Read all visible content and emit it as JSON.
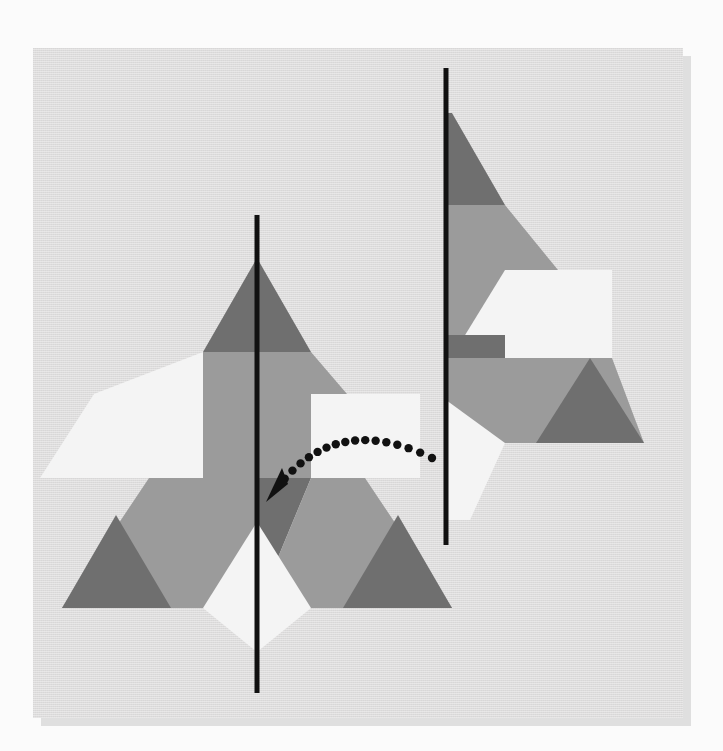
{
  "scene": {
    "title": "Mirror symmetry shape puzzle",
    "canvas": {
      "width": 723,
      "height": 751
    },
    "page_background": "#fbfbfb",
    "card": {
      "x": 33,
      "y": 48,
      "width": 650,
      "height": 670,
      "fill": "#dddcdc",
      "shadow_fill": "#c9c9c9",
      "shadow_offset": {
        "x": 8,
        "y": 8
      }
    }
  },
  "palette": {
    "dark_gray": "#6f6f6f",
    "mid_gray": "#9b9b9b",
    "light_gray": "#b0b0b0",
    "off_white": "#f4f4f4",
    "line_black": "#111111",
    "card_gray": "#dddcdc",
    "page_white": "#fbfbfb"
  },
  "mirror_lines": [
    {
      "name": "left-mirror-line",
      "x1": 257,
      "y1": 215,
      "x2": 257,
      "y2": 693,
      "stroke": "#111111",
      "stroke_width": 5
    },
    {
      "name": "right-mirror-line",
      "x1": 446,
      "y1": 68,
      "x2": 446,
      "y2": 545,
      "stroke": "#111111",
      "stroke_width": 5
    }
  ],
  "left_figure": {
    "name": "left-triskelion-figure",
    "description": "Full triangular pinwheel of hexagons, rhombi and triangles bisected by a vertical mirror line",
    "apex": {
      "x": 257,
      "y": 258
    },
    "baseline_y": 608,
    "left_corner_x": 62,
    "right_corner_x": 452,
    "pieces": [
      {
        "name": "top-dark-triangle",
        "fill": "#6f6f6f",
        "points": "257,258 311,352 203,352"
      },
      {
        "name": "upper-hex-left",
        "fill": "#9b9b9b",
        "points": "257,352 257,478 203,478 149,415 203,352"
      },
      {
        "name": "upper-hex-right",
        "fill": "#9b9b9b",
        "points": "257,352 311,352 365,415 311,478 257,478"
      },
      {
        "name": "left-white-rhombus",
        "fill": "#f4f4f4",
        "points": "94,394 203,394 149,478 40,478"
      },
      {
        "name": "left-white-rhombus-upper",
        "fill": "#f4f4f4",
        "points": "94,394 203,352 203,478 94,478"
      },
      {
        "name": "right-white-rhombus",
        "fill": "#f4f4f4",
        "points": "311,478 311,394 420,394 420,478"
      },
      {
        "name": "center-dark-rhombus",
        "fill": "#6f6f6f",
        "points": "257,478 311,478 257,608 203,478"
      },
      {
        "name": "left-hex",
        "fill": "#9b9b9b",
        "points": "203,478 257,478 257,608 116,608 62,608 149,478"
      },
      {
        "name": "right-hex",
        "fill": "#9b9b9b",
        "points": "311,478 365,478 452,608 257,608"
      },
      {
        "name": "left-bottom-triangle",
        "fill": "#6f6f6f",
        "points": "116,515 171,608 62,608"
      },
      {
        "name": "right-bottom-triangle",
        "fill": "#6f6f6f",
        "points": "398,515 452,608 343,608"
      },
      {
        "name": "bottom-white-rhombus",
        "fill": "#f4f4f4",
        "points": "257,522 311,608 257,652 203,608"
      }
    ]
  },
  "right_figure": {
    "name": "right-rotated-figure",
    "description": "Same motif rotated and clipped by the right vertical mirror line; only the portion right of the line is shown",
    "clip_x": 446,
    "apex": {
      "x": 452,
      "y": 113
    },
    "pieces": [
      {
        "name": "top-dark-triangle",
        "fill": "#6f6f6f",
        "points": "452,113 505,205 446,205 446,113"
      },
      {
        "name": "upper-mid-hex",
        "fill": "#9b9b9b",
        "points": "446,205 505,205 558,270 505,335 446,335"
      },
      {
        "name": "white-rhombus",
        "fill": "#f4f4f4",
        "points": "505,270 612,270 558,358 451,358"
      },
      {
        "name": "white-rhombus-fill",
        "fill": "#f4f4f4",
        "points": "505,270 612,270 612,358 505,358"
      },
      {
        "name": "left-dark-wedge",
        "fill": "#6f6f6f",
        "points": "446,335 505,335 505,400 446,400"
      },
      {
        "name": "center-hex",
        "fill": "#9b9b9b",
        "points": "505,358 612,358 644,443 505,443 446,443 446,358"
      },
      {
        "name": "lower-dark-triangle",
        "fill": "#6f6f6f",
        "points": "590,358 644,443 536,443"
      },
      {
        "name": "lower-white-rhombus",
        "fill": "#f4f4f4",
        "points": "446,400 505,443 470,520 446,520"
      }
    ]
  },
  "arrow": {
    "name": "transform-arrow",
    "style": "dotted-curved-arrow",
    "color": "#111111",
    "dot_radius": 4.2,
    "dot_count": 18,
    "start": {
      "x": 432,
      "y": 458
    },
    "end": {
      "x": 270,
      "y": 498
    },
    "control": {
      "x": 330,
      "y": 408
    },
    "arrowhead_points": "266,502 288,484 282,468"
  }
}
